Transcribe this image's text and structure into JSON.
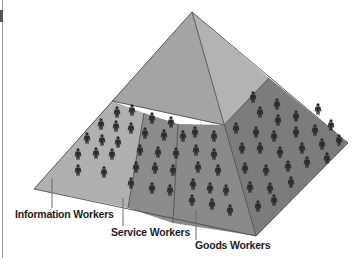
{
  "diagram": {
    "colors": {
      "top_left_face": "#a4a4a4",
      "top_right_face": "#b3b3b3",
      "info_band": "#b0b0b0",
      "service_band": "#8c8c8c",
      "goods_front_band": "#8a8a8a",
      "goods_right_band": "#7c7c7c",
      "edge": "#4d4d4d",
      "figure": "#2b2b2b",
      "leader": "#6a6a6a",
      "label": "#1e1e1e"
    },
    "labels": [
      {
        "id": "information",
        "text": "Information Workers",
        "x": 15,
        "y": 218,
        "leader": [
          52,
          178,
          52,
          208
        ]
      },
      {
        "id": "service",
        "text": "Service Workers",
        "x": 111,
        "y": 236,
        "leader": [
          123,
          198,
          123,
          226
        ]
      },
      {
        "id": "goods",
        "text": "Goods Workers",
        "x": 195,
        "y": 249,
        "leader": [
          196,
          210,
          196,
          240
        ]
      }
    ],
    "figures": {
      "information": [
        [
          117,
          112
        ],
        [
          132,
          110
        ],
        [
          101,
          124
        ],
        [
          116,
          126
        ],
        [
          131,
          128
        ],
        [
          87,
          138
        ],
        [
          102,
          140
        ],
        [
          118,
          142
        ],
        [
          78,
          154
        ],
        [
          96,
          153
        ],
        [
          112,
          154
        ],
        [
          78,
          170
        ],
        [
          104,
          172
        ]
      ],
      "service": [
        [
          152,
          118
        ],
        [
          171,
          122
        ],
        [
          145,
          133
        ],
        [
          164,
          135
        ],
        [
          183,
          136
        ],
        [
          140,
          150
        ],
        [
          158,
          152
        ],
        [
          176,
          153
        ],
        [
          136,
          167
        ],
        [
          155,
          168
        ],
        [
          173,
          170
        ],
        [
          131,
          183
        ],
        [
          152,
          188
        ],
        [
          170,
          190
        ]
      ],
      "goods_front": [
        [
          195,
          132
        ],
        [
          214,
          136
        ],
        [
          196,
          150
        ],
        [
          214,
          154
        ],
        [
          198,
          167
        ],
        [
          218,
          170
        ],
        [
          193,
          184
        ],
        [
          210,
          188
        ],
        [
          226,
          190
        ],
        [
          192,
          200
        ],
        [
          212,
          204
        ],
        [
          230,
          210
        ]
      ],
      "goods_right": [
        [
          253,
          97
        ],
        [
          277,
          104
        ],
        [
          260,
          112
        ],
        [
          278,
          120
        ],
        [
          296,
          116
        ],
        [
          318,
          109
        ],
        [
          236,
          128
        ],
        [
          256,
          132
        ],
        [
          274,
          136
        ],
        [
          296,
          132
        ],
        [
          315,
          130
        ],
        [
          331,
          125
        ],
        [
          242,
          148
        ],
        [
          260,
          148
        ],
        [
          280,
          152
        ],
        [
          302,
          148
        ],
        [
          322,
          144
        ],
        [
          339,
          140
        ],
        [
          245,
          168
        ],
        [
          266,
          170
        ],
        [
          288,
          166
        ],
        [
          307,
          162
        ],
        [
          327,
          158
        ],
        [
          250,
          187
        ],
        [
          270,
          188
        ],
        [
          291,
          182
        ],
        [
          258,
          206
        ],
        [
          274,
          200
        ]
      ]
    }
  }
}
